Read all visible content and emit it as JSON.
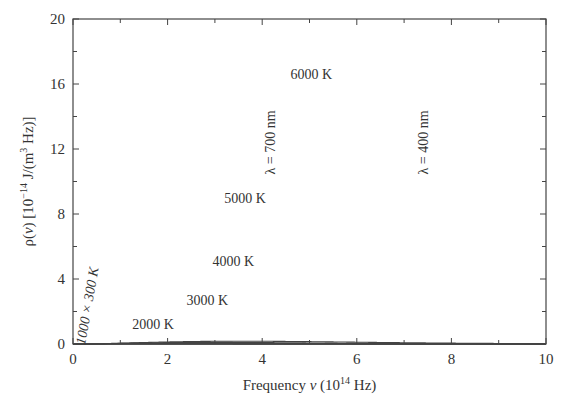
{
  "chart_data": {
    "type": "line",
    "title": "",
    "xlabel": "Frequency ν  (10^14 Hz)",
    "xlabel_parts": {
      "main": "Frequency ",
      "nu": "ν",
      "unit_open": "  (10",
      "exp": "14",
      "unit_close": " Hz)"
    },
    "ylabel": "ρ(ν)  [10^-14 J/(m^3 Hz)]",
    "ylabel_parts": {
      "rho": "ρ(",
      "nu": "ν",
      "close": ")  [10",
      "exp": "−14",
      "mid": " J/(m",
      "exp2": "3",
      "end": " Hz)]"
    },
    "xlim": [
      0,
      10
    ],
    "ylim": [
      0,
      20
    ],
    "xticks": [
      0,
      2,
      4,
      6,
      8,
      10
    ],
    "yticks": [
      0,
      4,
      8,
      12,
      16,
      20
    ],
    "grid": false,
    "series": [
      {
        "name": "6000 K",
        "T": 6000,
        "scale": 1,
        "x": [
          0,
          1,
          2,
          3,
          3.5,
          4,
          5,
          6,
          7,
          8,
          9,
          10
        ],
        "values": [
          0,
          2.9,
          11.0,
          16.5,
          17.1,
          16.6,
          13.4,
          9.3,
          5.9,
          3.4,
          1.9,
          1.0
        ]
      },
      {
        "name": "5000 K",
        "T": 5000,
        "scale": 1,
        "x": [
          0,
          1,
          2,
          2.9,
          3,
          4,
          5,
          6,
          7,
          8,
          9,
          10
        ],
        "values": [
          0,
          2.6,
          8.0,
          9.9,
          9.9,
          8.1,
          5.2,
          2.9,
          1.4,
          0.7,
          0.3,
          0.1
        ]
      },
      {
        "name": "4000 K",
        "T": 4000,
        "scale": 1,
        "x": [
          0,
          1,
          2,
          2.3,
          3,
          4,
          5,
          6,
          7,
          8,
          9,
          10
        ],
        "values": [
          0,
          2.1,
          4.9,
          5.1,
          4.7,
          2.9,
          1.4,
          0.6,
          0.2,
          0.1,
          0,
          0
        ]
      },
      {
        "name": "3000 K",
        "T": 3000,
        "scale": 1,
        "x": [
          0,
          1,
          1.7,
          2,
          3,
          4,
          5,
          6,
          7,
          8
        ],
        "values": [
          0,
          1.7,
          2.1,
          2.1,
          1.4,
          0.6,
          0.2,
          0.1,
          0,
          0
        ]
      },
      {
        "name": "2000 K",
        "T": 2000,
        "scale": 1,
        "x": [
          0,
          0.5,
          1.1,
          1.5,
          2,
          3,
          4,
          5
        ],
        "values": [
          0,
          0.4,
          0.6,
          0.6,
          0.5,
          0.2,
          0.05,
          0
        ]
      },
      {
        "name": "1000 × 300 K",
        "T": 300,
        "scale": 1000,
        "x": [
          0,
          0.1,
          0.18,
          0.3,
          0.4,
          0.5,
          0.7
        ],
        "values": [
          0,
          1.4,
          2.2,
          1.3,
          0.5,
          0.2,
          0
        ]
      }
    ],
    "annotations": [
      {
        "text": "6000 K",
        "x": 4.6,
        "y": 16.3
      },
      {
        "text": "5000 K",
        "x": 3.2,
        "y": 8.7
      },
      {
        "text": "4000 K",
        "x": 2.95,
        "y": 4.8
      },
      {
        "text": "3000 K",
        "x": 2.4,
        "y": 2.4
      },
      {
        "text": "2000 K",
        "x": 1.25,
        "y": 0.95
      },
      {
        "text": "1000 × 300 K",
        "x": 0.4,
        "y": 2.3,
        "rotation": -80
      },
      {
        "text": "λ = 700 nm",
        "x": 4.28,
        "y": 12.4,
        "rotation": -90
      },
      {
        "text": "λ = 400 nm",
        "x": 7.5,
        "y": 12.4,
        "rotation": -90
      }
    ]
  }
}
